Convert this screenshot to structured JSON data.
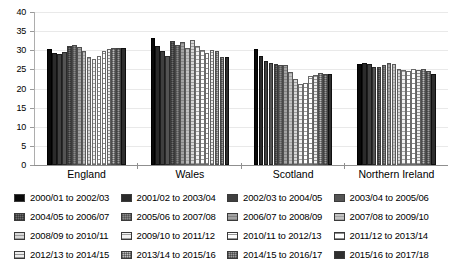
{
  "chart_data": {
    "type": "bar",
    "title": "",
    "subtitle": "",
    "xlabel": "",
    "ylabel": "",
    "ylim": [
      0,
      40
    ],
    "ytick_values": [
      40,
      35,
      30,
      25,
      20,
      15,
      10,
      5,
      0
    ],
    "ytick_labels": [
      "40",
      "35",
      "30",
      "25",
      "20",
      "15",
      "10",
      "5",
      "0"
    ],
    "grid": true,
    "legend_position": "bottom",
    "categories": [
      "England",
      "Wales",
      "Scotland",
      "Northern Ireland"
    ],
    "series": [
      {
        "name": "2000/01 to 2002/03",
        "values": [
          30.2,
          33.3,
          30.2,
          26.5
        ]
      },
      {
        "name": "2001/02 to 2003/04",
        "values": [
          29.2,
          31.1,
          28.5,
          26.6
        ]
      },
      {
        "name": "2002/03 to 2004/05",
        "values": [
          29.0,
          29.9,
          27.3,
          26.4
        ]
      },
      {
        "name": "2003/04 to 2005/06",
        "values": [
          29.5,
          28.4,
          26.6,
          25.7
        ]
      },
      {
        "name": "2004/05 to 2006/07",
        "values": [
          31.0,
          32.3,
          26.3,
          25.6
        ]
      },
      {
        "name": "2005/06 to 2007/08",
        "values": [
          31.3,
          31.4,
          26.2,
          26.2
        ]
      },
      {
        "name": "2006/07 to 2008/09",
        "values": [
          30.8,
          32.2,
          26.1,
          26.6
        ]
      },
      {
        "name": "2007/08 to 2009/10",
        "values": [
          29.7,
          30.6,
          24.4,
          26.3
        ]
      },
      {
        "name": "2008/09 to 2010/11",
        "values": [
          28.2,
          32.6,
          22.6,
          25.2
        ]
      },
      {
        "name": "2009/10 to 2011/12",
        "values": [
          27.7,
          31.2,
          21.2,
          24.8
        ]
      },
      {
        "name": "2010/11 to 2012/13",
        "values": [
          28.6,
          30.0,
          21.4,
          24.6
        ]
      },
      {
        "name": "2011/12 to 2013/14",
        "values": [
          29.9,
          29.3,
          23.4,
          25.0
        ]
      },
      {
        "name": "2012/13 to 2014/15",
        "values": [
          30.4,
          30.0,
          23.6,
          24.9
        ]
      },
      {
        "name": "2013/14 to 2015/16",
        "values": [
          30.5,
          29.9,
          24.0,
          25.1
        ]
      },
      {
        "name": "2014/15 to 2016/17",
        "values": [
          30.7,
          28.2,
          23.9,
          24.5
        ]
      },
      {
        "name": "2015/16 to 2017/18",
        "values": [
          30.6,
          28.3,
          23.8,
          23.9
        ]
      }
    ]
  },
  "legend": {
    "entries": [
      "2000/01 to 2002/03",
      "2001/02 to 2003/04",
      "2002/03 to 2004/05",
      "2003/04 to 2005/06",
      "2004/05 to 2006/07",
      "2005/06 to 2007/08",
      "2006/07 to 2008/09",
      "2007/08 to 2009/10",
      "2008/09 to 2010/11",
      "2009/10 to 2011/12",
      "2010/11 to 2012/13",
      "2011/12 to 2013/14",
      "2012/13 to 2014/15",
      "2013/14 to 2015/16",
      "2014/15 to 2016/17",
      "2015/16 to 2017/18"
    ]
  },
  "colors": {
    "axis": "#8f8f8f",
    "gridline": "#e9e9e9",
    "text": "#000000",
    "background": "#ffffff"
  }
}
